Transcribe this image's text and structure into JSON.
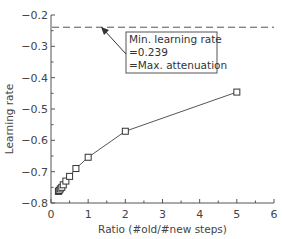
{
  "chart_data": {
    "type": "scatter",
    "title": "",
    "xlabel": "Ratio (#old/#new steps)",
    "ylabel": "Learning rate",
    "xlim": [
      0,
      6
    ],
    "ylim": [
      -0.8,
      -0.2
    ],
    "xticks": [
      "0",
      "1",
      "2",
      "3",
      "4",
      "5",
      "6"
    ],
    "yticks": [
      "-0.2",
      "-0.3",
      "-0.4",
      "-0.5",
      "-0.6",
      "-0.7",
      "-0.8"
    ],
    "grid": false,
    "series": [
      {
        "name": "Learning rate vs ratio",
        "marker": "square",
        "line": "solid",
        "x": [
          0.2,
          0.22,
          0.25,
          0.29,
          0.33,
          0.4,
          0.5,
          0.67,
          1,
          2,
          5
        ],
        "y": [
          -0.763,
          -0.76,
          -0.755,
          -0.75,
          -0.742,
          -0.73,
          -0.715,
          -0.69,
          -0.654,
          -0.571,
          -0.446
        ]
      },
      {
        "name": "Min. learning rate",
        "line": "dashed",
        "y_constant": -0.239
      }
    ],
    "annotation": {
      "lines": [
        "Min. learning rate",
        "=0.239",
        "=Max. attenuation"
      ],
      "arrow_target": [
        0.47,
        -0.239
      ]
    },
    "colors": {
      "line": "#555555",
      "axis": "#555555",
      "text": "#444444"
    }
  }
}
